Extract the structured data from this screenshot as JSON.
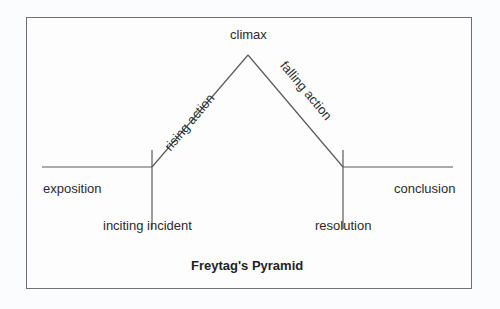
{
  "diagram": {
    "title": "Freytag's Pyramid",
    "stages": {
      "exposition": "exposition",
      "inciting_incident": "inciting incident",
      "rising_action": "rising action",
      "climax": "climax",
      "falling_action": "falling action",
      "resolution": "resolution",
      "conclusion": "conclusion"
    },
    "colors": {
      "line": "#5a5a5e",
      "frame": "#6f6f74",
      "text": "#2b2b2b",
      "background": "#fbfcfd"
    }
  }
}
